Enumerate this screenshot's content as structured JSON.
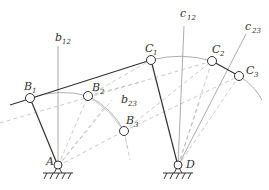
{
  "diagram": {
    "labels": {
      "A": {
        "main": "A",
        "sub": ""
      },
      "D": {
        "main": "D",
        "sub": ""
      },
      "B1": {
        "main": "B",
        "sub": "1"
      },
      "B2": {
        "main": "B",
        "sub": "2"
      },
      "B3": {
        "main": "B",
        "sub": "3"
      },
      "C1": {
        "main": "C",
        "sub": "1"
      },
      "C2": {
        "main": "C",
        "sub": "2"
      },
      "C3": {
        "main": "C",
        "sub": "3"
      },
      "b12": {
        "main": "b",
        "sub": "12"
      },
      "b23": {
        "main": "b",
        "sub": "23"
      },
      "c12": {
        "main": "c",
        "sub": "12"
      },
      "c23": {
        "main": "c",
        "sub": "23"
      }
    },
    "points": {
      "A": [
        58,
        166
      ],
      "D": [
        178,
        166
      ],
      "B1": [
        30,
        98
      ],
      "B2": [
        88,
        96
      ],
      "B3": [
        124,
        131
      ],
      "C1": [
        151,
        60
      ],
      "C2": [
        212,
        61
      ],
      "C3": [
        239,
        76
      ]
    },
    "colors": {
      "link": "#333333",
      "construction": "#999999",
      "dashed": "#b0b0b0"
    }
  }
}
